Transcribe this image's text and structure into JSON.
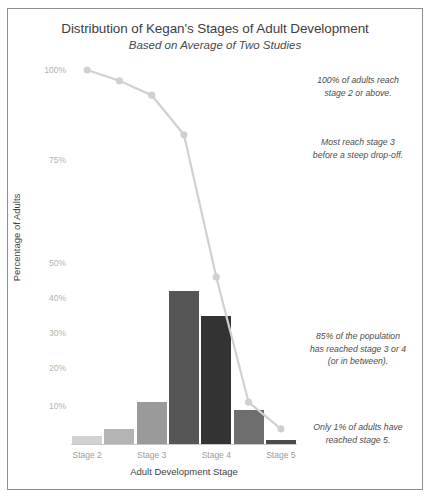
{
  "chart_data": {
    "type": "bar",
    "title": "Distribution of Kegan's Stages of Adult Development",
    "subtitle": "Based on Average of Two Studies",
    "xlabel": "Adult Development Stage",
    "ylabel": "Percentage of Adults",
    "ylim": [
      0,
      105
    ],
    "grid": false,
    "legend": "none",
    "ytick_labels": [
      "100%",
      "75%",
      "50%",
      "40%",
      "30%",
      "20%",
      "10%"
    ],
    "ytick_values": [
      100,
      75,
      50,
      40,
      30,
      20,
      10
    ],
    "xtick_labels": [
      "Stage 2",
      "Stage 3",
      "Stage 4",
      "Stage 5"
    ],
    "categories": [
      "Stage 2",
      "Stage 2/3",
      "Stage 3",
      "Stage 3/4",
      "Stage 4",
      "Stage 4/5",
      "Stage 5"
    ],
    "values": [
      2,
      4,
      11,
      42,
      35,
      9,
      1
    ],
    "bar_colors": [
      "#d2d2d2",
      "#b4b4b4",
      "#9a9a9a",
      "#565656",
      "#333333",
      "#6e6e6e",
      "#4a4a4a"
    ],
    "series": [
      {
        "name": "Cumulative percentage reaching stage or above",
        "type": "line",
        "color": "#d0d0d0",
        "x": [
          "Stage 2",
          "Stage 2/3",
          "Stage 3",
          "Stage 3/4",
          "Stage 4",
          "Stage 4/5",
          "Stage 5"
        ],
        "values": [
          100,
          97,
          93,
          82,
          46,
          11,
          4
        ]
      }
    ],
    "annotations": [
      "100% of adults reach stage 2 or above.",
      "Most reach stage 3 before a steep drop-off.",
      "85% of the population has reached stage 3 or 4 (or in between).",
      "Only 1% of adults have reached stage 5."
    ]
  },
  "annotations_lines": {
    "a1": [
      "100% of adults reach",
      "stage 2 or above."
    ],
    "a2": [
      "Most reach stage 3",
      "before a steep drop-off."
    ],
    "a3": [
      "85% of the population",
      "has reached stage 3 or 4",
      "(or in between)."
    ],
    "a4": [
      "Only 1% of adults have",
      "reached stage 5."
    ]
  }
}
